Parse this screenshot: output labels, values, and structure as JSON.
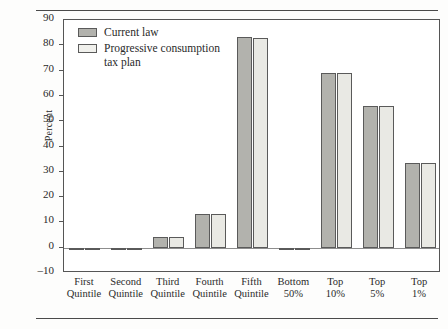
{
  "chart_data": {
    "type": "bar",
    "title": "",
    "xlabel": "",
    "ylabel": "Percent",
    "ylim": [
      -10,
      90
    ],
    "ytick_step": 10,
    "yticks": [
      90,
      80,
      70,
      60,
      50,
      40,
      30,
      20,
      10,
      0,
      -10
    ],
    "ytick_labels": [
      "90",
      "80",
      "70",
      "60",
      "50",
      "40",
      "30",
      "20",
      "10",
      "0",
      "–10"
    ],
    "grid": false,
    "legend_position": "top-left-inside",
    "categories": [
      "First\nQuintile",
      "Second\nQuintile",
      "Third\nQuintile",
      "Fourth\nQuintile",
      "Fifth\nQuintile",
      "Bottom\n50%",
      "Top\n10%",
      "Top\n5%",
      "Top\n1%"
    ],
    "series": [
      {
        "name": "Current law",
        "color": "#b2b2ad",
        "values": [
          -0.7,
          -1.0,
          4.2,
          13.5,
          83.2,
          -0.6,
          69.0,
          56.0,
          33.5
        ]
      },
      {
        "name": "Progressive consumption tax plan",
        "color": "#e9e9e4",
        "values": [
          -0.6,
          -1.0,
          4.2,
          13.4,
          83.0,
          -0.6,
          69.0,
          56.2,
          33.6
        ]
      }
    ]
  },
  "legend": {
    "entries": [
      {
        "label": "Current law"
      },
      {
        "label": "Progressive consumption\ntax plan"
      }
    ]
  },
  "axis": {
    "y_title": "Percent"
  }
}
